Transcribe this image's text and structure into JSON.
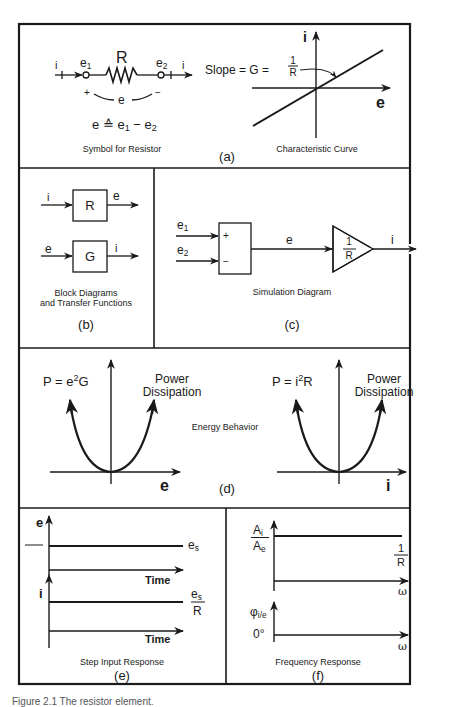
{
  "panel_a": {
    "label": "(a)",
    "symbol_caption": "Symbol for Resistor",
    "curve_caption": "Characteristic Curve",
    "resistor_label": "R",
    "node1": "e",
    "node1_sub": "1",
    "node2": "e",
    "node2_sub": "2",
    "current_in": "i",
    "current_out": "i",
    "plus": "+",
    "minus": "−",
    "across": "e",
    "definition": "e ≙ e",
    "definition_sub1": "1",
    "definition_mid": " − e",
    "definition_sub2": "2",
    "slope_label": "Slope = G =",
    "slope_num": "1",
    "slope_den": "R",
    "axis_y": "i",
    "axis_x": "e"
  },
  "panel_b": {
    "label": "(b)",
    "caption_line1": "Block Diagrams",
    "caption_line2": "and Transfer Functions",
    "block1": {
      "input": "i",
      "box": "R",
      "output": "e"
    },
    "block2": {
      "input": "e",
      "box": "G",
      "output": "i"
    }
  },
  "panel_c": {
    "label": "(c)",
    "caption": "Simulation Diagram",
    "in1": "e",
    "in1_sub": "1",
    "in2": "e",
    "in2_sub": "2",
    "plus": "+",
    "minus": "−",
    "mid_signal": "e",
    "gain_num": "1",
    "gain_den": "R",
    "output": "i"
  },
  "panel_d": {
    "label": "(d)",
    "caption": "Energy Behavior",
    "left": {
      "eq_pre": "P = e",
      "eq_sup": "2",
      "eq_post": "G",
      "title1": "Power",
      "title2": "Dissipation",
      "axis_x": "e"
    },
    "right": {
      "eq_pre": "P = i",
      "eq_sup": "2",
      "eq_post": "R",
      "title1": "Power",
      "title2": "Dissipation",
      "axis_x": "i"
    }
  },
  "panel_e": {
    "label": "(e)",
    "caption": "Step Input Response",
    "top": {
      "axis_y": "e",
      "axis_x": "Time",
      "level": "e",
      "level_sub": "s"
    },
    "bottom": {
      "axis_y": "i",
      "axis_x": "Time",
      "level_num": "e",
      "level_num_sub": "s",
      "level_den": "R"
    }
  },
  "panel_f": {
    "label": "(f)",
    "caption": "Frequency Response",
    "top": {
      "axis_y_num": "A",
      "axis_y_num_sub": "i",
      "axis_y_den": "A",
      "axis_y_den_sub": "e",
      "axis_x": "ω",
      "level_num": "1",
      "level_den": "R"
    },
    "bottom": {
      "axis_y": "φ",
      "axis_y_sub": "i/e",
      "zero": "0°",
      "axis_x": "ω"
    }
  },
  "figure_caption": "Figure 2.1   The resistor element."
}
